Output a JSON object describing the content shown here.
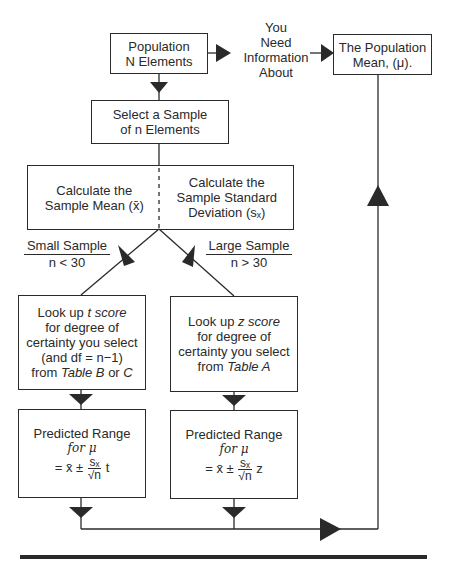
{
  "nodes": {
    "population": {
      "line1": "Population",
      "line2": "N Elements"
    },
    "connector_text": {
      "line1": "You",
      "line2": "Need",
      "line3": "Information",
      "line4": "About"
    },
    "population_mean": {
      "line1": "The Population",
      "line2": "Mean, (μ)."
    },
    "select_sample": {
      "line1": "Select a Sample",
      "line2": "of n Elements"
    },
    "calc_mean": {
      "line1": "Calculate the",
      "line2": "Sample Mean (x̄)"
    },
    "calc_sd": {
      "line1": "Calculate the",
      "line2": "Sample Standard",
      "line3": "Deviation (sₓ)"
    },
    "small_sample": {
      "label": "Small Sample",
      "condition": "n < 30"
    },
    "large_sample": {
      "label": "Large Sample",
      "condition": "n > 30"
    },
    "t_lookup": {
      "prefix": "Look up ",
      "term": "t score",
      "line2": "for degree of",
      "line3": "certainty you select",
      "line4": "(and df = n−1)",
      "line5_pre": "from ",
      "line5_table": "Table B",
      "line5_mid": " or ",
      "line5_end": "C"
    },
    "z_lookup": {
      "prefix": "Look up ",
      "term": "z score",
      "line2": "for degree of",
      "line3": "certainty you select",
      "line4_pre": "from ",
      "line4_table": "Table A"
    },
    "t_range": {
      "line1": "Predicted Range",
      "line2": "for μ",
      "formula_pre": "= x̄ ±",
      "num": "sₓ",
      "den": "√n",
      "factor": "t"
    },
    "z_range": {
      "line1": "Predicted Range",
      "line2": "for μ",
      "formula_pre": "= x̄ ±",
      "num": "sₓ",
      "den": "√n",
      "factor": "z"
    }
  },
  "colors": {
    "stroke": "#2a2a2a",
    "background": "#ffffff"
  }
}
